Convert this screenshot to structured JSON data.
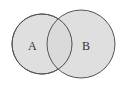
{
  "diagram": {
    "type": "venn",
    "sets": [
      {
        "label": "A",
        "cx": 42,
        "cy": 44,
        "r": 30
      },
      {
        "label": "B",
        "cx": 81,
        "cy": 44,
        "r": 34
      }
    ],
    "fill": "#d9d9d9",
    "stroke": "#555555"
  }
}
